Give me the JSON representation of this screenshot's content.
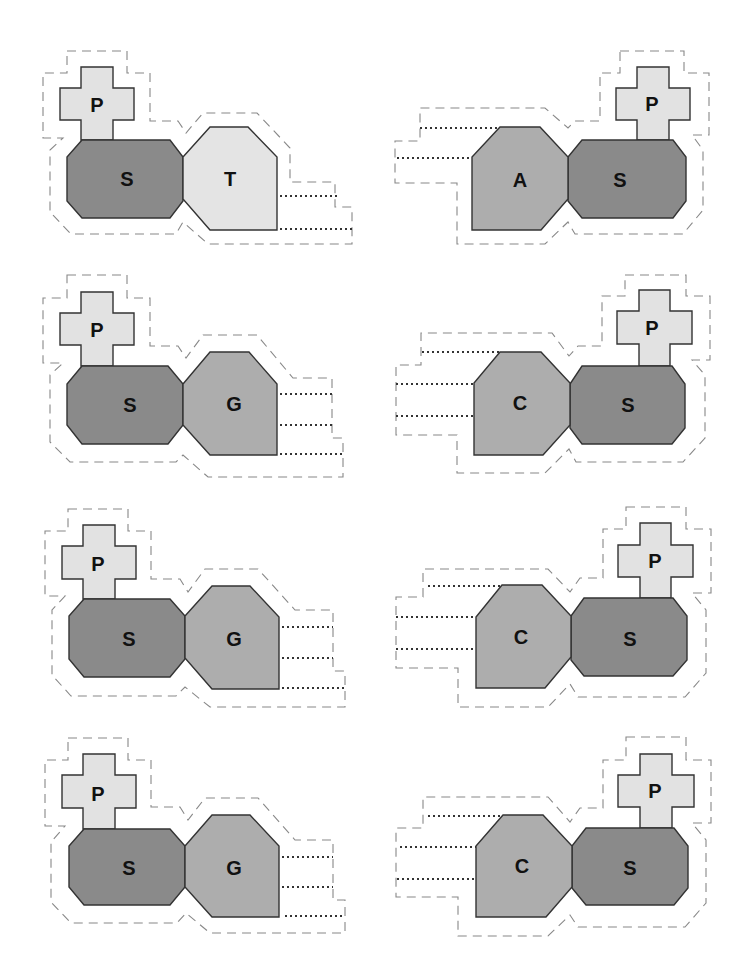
{
  "diagram": {
    "colors": {
      "phosphate": "#e2e2e2",
      "sugar": "#8a8a8a",
      "base_pyrimidine_T": "#e4e4e4",
      "base_purine": "#adadad",
      "outline": "#888888",
      "stroke": "#333333",
      "background": "#ffffff"
    },
    "units": [
      {
        "position": "row1-left",
        "phosphate": "P",
        "sugar": "S",
        "base": "T",
        "bonds": 2
      },
      {
        "position": "row1-right",
        "phosphate": "P",
        "sugar": "S",
        "base": "A",
        "bonds": 2
      },
      {
        "position": "row2-left",
        "phosphate": "P",
        "sugar": "S",
        "base": "G",
        "bonds": 3
      },
      {
        "position": "row2-right",
        "phosphate": "P",
        "sugar": "S",
        "base": "C",
        "bonds": 3
      },
      {
        "position": "row3-left",
        "phosphate": "P",
        "sugar": "S",
        "base": "G",
        "bonds": 3
      },
      {
        "position": "row3-right",
        "phosphate": "P",
        "sugar": "S",
        "base": "C",
        "bonds": 3
      },
      {
        "position": "row4-left",
        "phosphate": "P",
        "sugar": "S",
        "base": "G",
        "bonds": 3
      },
      {
        "position": "row4-right",
        "phosphate": "P",
        "sugar": "S",
        "base": "C",
        "bonds": 3
      }
    ]
  }
}
